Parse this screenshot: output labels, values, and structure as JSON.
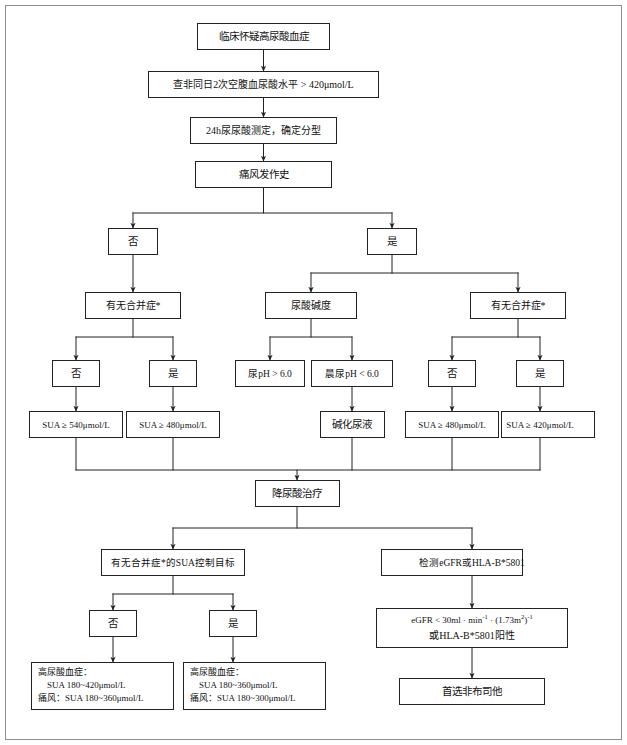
{
  "figure": {
    "kind": "clinical-flowchart",
    "border_color": "#8e8e8e",
    "box_stroke": "#222222",
    "box_fill": "#ffffff",
    "text_color": "#111111"
  },
  "nodes": {
    "n01_clinical_suspicion": {
      "label": "临床怀疑高尿酸血症"
    },
    "n02_fasting_sua": {
      "label": "查非同日2次空腹血尿酸水平 > 420μmol/L"
    },
    "n03_24h_urine": {
      "label": "24h尿尿酸测定，确定分型"
    },
    "n04_gout_history": {
      "label": "痛风发作史"
    },
    "n05_gout_no": {
      "label": "否"
    },
    "n06_gout_yes": {
      "label": "是"
    },
    "n07_comorbid_left": {
      "label": "有无合并症*"
    },
    "n08_urine_alkalinity": {
      "label": "尿酸碱度"
    },
    "n09_comorbid_right": {
      "label": "有无合并症*"
    },
    "n10_left_no": {
      "label": "否"
    },
    "n11_left_yes": {
      "label": "是"
    },
    "n12_urine_ph_high": {
      "label": "尿pH > 6.0"
    },
    "n13_morning_ph_low": {
      "label": "晨尿pH < 6.0"
    },
    "n14_right_no": {
      "label": "否"
    },
    "n15_right_yes": {
      "label": "是"
    },
    "n16_sua_540": {
      "label": "SUA ≥ 540μmol/L"
    },
    "n17_sua_480_left": {
      "label": "SUA ≥ 480μmol/L"
    },
    "n18_alkalinize": {
      "label": "碱化尿液"
    },
    "n19_sua_480_right": {
      "label": "SUA ≥ 480μmol/L"
    },
    "n20_sua_420": {
      "label": "SUA ≥ 420μmol/L"
    },
    "n21_urate_lowering": {
      "label": "降尿酸治疗"
    },
    "n22_sua_target": {
      "label": "有无合并症*的SUA控制目标"
    },
    "n23_test_egfr_hla": {
      "label": "检测eGFR或HLA-B*5801"
    },
    "n24_target_no": {
      "label": "否"
    },
    "n25_target_yes": {
      "label": "是"
    },
    "n26_egfr_condition": {
      "line1_prefix": "eGFR < 30ml · min",
      "line1_sup1": "-1",
      "line1_mid": " · (1.73m",
      "line1_sup2": "2",
      "line1_close": ")",
      "line1_sup3": "-1",
      "line2": "或HLA-B*5801阳性"
    },
    "n27_result_no_comorbid": {
      "line1": "高尿酸血症：",
      "line2": "SUA 180~420μmol/L",
      "line3": "痛风：SUA 180~360μmol/L"
    },
    "n28_result_with_comorbid": {
      "line1": "高尿酸血症：",
      "line2": "SUA 180~360μmol/L",
      "line3": "痛风：SUA 180~300μmol/L"
    },
    "n29_febuxostat": {
      "label": "首选非布司他"
    }
  },
  "edges": [
    {
      "from": "n01_clinical_suspicion",
      "to": "n02_fasting_sua",
      "arrow": true
    },
    {
      "from": "n02_fasting_sua",
      "to": "n03_24h_urine",
      "arrow": true
    },
    {
      "from": "n03_24h_urine",
      "to": "n04_gout_history",
      "arrow": true
    },
    {
      "from": "n04_gout_history",
      "to": "n05_gout_no",
      "arrow": true
    },
    {
      "from": "n04_gout_history",
      "to": "n06_gout_yes",
      "arrow": true
    },
    {
      "from": "n05_gout_no",
      "to": "n07_comorbid_left",
      "arrow": true
    },
    {
      "from": "n06_gout_yes",
      "to": "n08_urine_alkalinity",
      "arrow": true
    },
    {
      "from": "n06_gout_yes",
      "to": "n09_comorbid_right",
      "arrow": true
    },
    {
      "from": "n07_comorbid_left",
      "to": "n10_left_no",
      "arrow": true
    },
    {
      "from": "n07_comorbid_left",
      "to": "n11_left_yes",
      "arrow": true
    },
    {
      "from": "n08_urine_alkalinity",
      "to": "n12_urine_ph_high",
      "arrow": true
    },
    {
      "from": "n08_urine_alkalinity",
      "to": "n13_morning_ph_low",
      "arrow": true
    },
    {
      "from": "n09_comorbid_right",
      "to": "n14_right_no",
      "arrow": true
    },
    {
      "from": "n09_comorbid_right",
      "to": "n15_right_yes",
      "arrow": true
    },
    {
      "from": "n10_left_no",
      "to": "n16_sua_540",
      "arrow": true
    },
    {
      "from": "n11_left_yes",
      "to": "n17_sua_480_left",
      "arrow": true
    },
    {
      "from": "n13_morning_ph_low",
      "to": "n18_alkalinize",
      "arrow": true
    },
    {
      "from": "n14_right_no",
      "to": "n19_sua_480_right",
      "arrow": true
    },
    {
      "from": "n15_right_yes",
      "to": "n20_sua_420",
      "arrow": true
    },
    {
      "from": "merge-bus",
      "to": "n21_urate_lowering",
      "arrow": true
    },
    {
      "from": "n21_urate_lowering",
      "to": "n22_sua_target",
      "arrow": true
    },
    {
      "from": "n21_urate_lowering",
      "to": "n23_test_egfr_hla",
      "arrow": true
    },
    {
      "from": "n22_sua_target",
      "to": "n24_target_no",
      "arrow": true
    },
    {
      "from": "n22_sua_target",
      "to": "n25_target_yes",
      "arrow": true
    },
    {
      "from": "n23_test_egfr_hla",
      "to": "n26_egfr_condition",
      "arrow": true
    },
    {
      "from": "n24_target_no",
      "to": "n27_result_no_comorbid",
      "arrow": true
    },
    {
      "from": "n25_target_yes",
      "to": "n28_result_with_comorbid",
      "arrow": true
    },
    {
      "from": "n26_egfr_condition",
      "to": "n29_febuxostat",
      "arrow": true
    }
  ]
}
